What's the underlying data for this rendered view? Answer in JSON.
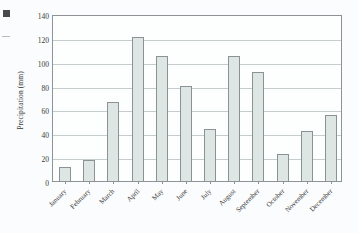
{
  "figure": {
    "margin_marks": [
      {
        "name": "scan-artifact-square"
      },
      {
        "name": "scan-artifact-dash"
      }
    ]
  },
  "chart_data": {
    "type": "bar",
    "title": "",
    "xlabel": "",
    "ylabel": "Precipitation (mm)",
    "ylim": [
      0,
      140
    ],
    "ytick_step": 20,
    "yticks": [
      0,
      20,
      40,
      60,
      80,
      100,
      120,
      140
    ],
    "ytick_labels": [
      "0",
      "20",
      "40",
      "60",
      "80",
      "100",
      "120",
      "140"
    ],
    "grid": true,
    "grid_axis": "y",
    "legend": false,
    "legend_position": "none",
    "categories": [
      "January",
      "February",
      "March",
      "April",
      "May",
      "June",
      "July",
      "August",
      "September",
      "October",
      "November",
      "December"
    ],
    "values": [
      12,
      18,
      66,
      121,
      105,
      80,
      44,
      105,
      91,
      23,
      42,
      55
    ],
    "bar_fill_color": "#dde6e2",
    "bar_edge_color": "#8b9295",
    "axis_color": "#8d9396",
    "gridline_color": "#c6cdcf",
    "text_color": "#3a3a3a",
    "background_color": "#fbfcfd",
    "xtick_label_rotation": -45
  }
}
